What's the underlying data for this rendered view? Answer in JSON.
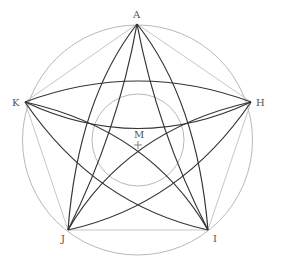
{
  "diagram": {
    "outer_circle": {
      "cx": 137.5,
      "cy": 140,
      "r": 115,
      "color": "#b8b8b8"
    },
    "inner_circle": {
      "cx": 138,
      "cy": 140,
      "r": 46,
      "color": "#b8b8b8"
    },
    "pentagon_color": "#c0c0c0",
    "arc_color": "#333333",
    "vertices": {
      "A": {
        "x": 137,
        "y": 24
      },
      "H": {
        "x": 251,
        "y": 102
      },
      "I": {
        "x": 208,
        "y": 230
      },
      "J": {
        "x": 68,
        "y": 230
      },
      "K": {
        "x": 25,
        "y": 102
      }
    },
    "labels": {
      "A": "A",
      "H": "H",
      "I": "I",
      "J": "J",
      "K": "K",
      "M": "M"
    },
    "center_mark": "+"
  }
}
